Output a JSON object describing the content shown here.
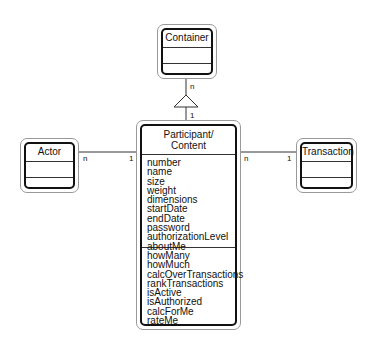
{
  "diagram": {
    "type": "UML class diagram",
    "classes": {
      "container": {
        "name": "Container",
        "attributes": [],
        "operations": []
      },
      "actor": {
        "name": "Actor",
        "attributes": [],
        "operations": []
      },
      "transaction": {
        "name": "Transaction",
        "attributes": [],
        "operations": []
      },
      "participant": {
        "name_line1": "Participant/",
        "name_line2": "Content",
        "attributes": [
          "number",
          "name",
          "size",
          "weight",
          "dimensions",
          "startDate",
          "endDate",
          "password",
          "authorizationLevel",
          "aboutMe"
        ],
        "operations": [
          "howMany",
          "howMuch",
          "calcOverTransactions",
          "rankTransactions",
          "isActive",
          "isAuthorized",
          "calcForMe",
          "rateMe"
        ]
      }
    },
    "relationships": [
      {
        "from": "Participant/Content",
        "to": "Container",
        "kind": "aggregation-triangle",
        "mult_container": "n",
        "mult_participant": "1"
      },
      {
        "from": "Actor",
        "to": "Participant/Content",
        "mult_actor": "n",
        "mult_participant": "1"
      },
      {
        "from": "Participant/Content",
        "to": "Transaction",
        "mult_participant": "n",
        "mult_transaction": "1"
      }
    ]
  }
}
